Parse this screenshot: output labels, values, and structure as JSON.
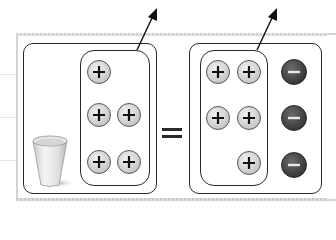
{
  "diagram": {
    "title": "",
    "equation_sign": "=",
    "left_side": {
      "container_label": "cup with positive charges",
      "object": "cup-icon",
      "group": {
        "charge": "positive",
        "symbol": "+",
        "rows": [
          1,
          2,
          2
        ],
        "count": 5
      },
      "arrow": "arrow pointing up-right from grouped charges"
    },
    "right_side": {
      "group": {
        "charge": "positive",
        "symbol": "+",
        "rows": [
          2,
          2,
          1
        ],
        "count": 5
      },
      "separate": {
        "charge": "negative",
        "symbol": "−",
        "count": 3
      },
      "arrow": "arrow pointing up-right from grouped charges"
    },
    "colors": {
      "positive_fill": "#d0d0d0",
      "negative_fill": "#3c3c3c",
      "outline": "#2a2a2a",
      "frame": "#d4d4d4"
    }
  }
}
